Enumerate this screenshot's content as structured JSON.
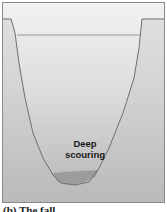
{
  "figure": {
    "label": "Deep scouring",
    "label_lines": [
      "Deep",
      "scouring"
    ],
    "caption": "(b) The fall"
  },
  "colors": {
    "background_top": "#f2f2f2",
    "background_bottom": "#b5b5b5",
    "channel_line": "#6f6f6f",
    "water_line": "#9a9a9a",
    "sediment": "#9c9c9c"
  }
}
